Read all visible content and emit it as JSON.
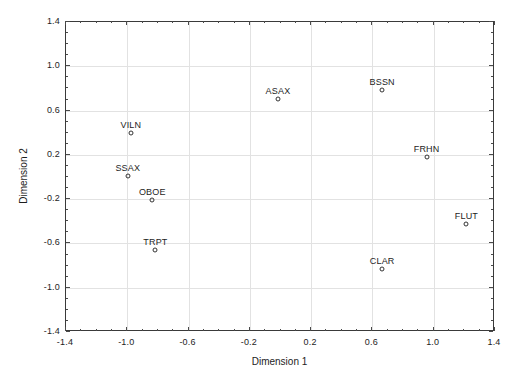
{
  "chart_data": {
    "type": "scatter",
    "title": "",
    "xlabel": "Dimension 1",
    "ylabel": "Dimension 2",
    "xlim": [
      -1.4,
      1.4
    ],
    "ylim": [
      -1.4,
      1.4
    ],
    "xticks": [
      -1.4,
      -1.0,
      -0.6,
      -0.2,
      0.2,
      0.6,
      1.0,
      1.4
    ],
    "yticks": [
      -1.4,
      -1.0,
      -0.6,
      -0.2,
      0.2,
      0.6,
      1.0,
      1.4
    ],
    "xticklabels": [
      "-1.4",
      "-1.0",
      "-0.6",
      "-0.2",
      "0.2",
      "0.6",
      "1.0",
      "1.4"
    ],
    "yticklabels": [
      "-1.4",
      "-1.0",
      "-0.6",
      "-0.2",
      "0.2",
      "0.6",
      "1.0",
      "1.4"
    ],
    "minor_ticks": true,
    "grid": true,
    "grid_color": "#e2e2e2",
    "legend": "none",
    "marker": "open-circle",
    "marker_color": "#333333",
    "points": [
      {
        "label": "VILN",
        "x": -0.97,
        "y": 0.39
      },
      {
        "label": "SSAX",
        "x": -0.99,
        "y": 0.0
      },
      {
        "label": "OBOE",
        "x": -0.83,
        "y": -0.22
      },
      {
        "label": "TRPT",
        "x": -0.81,
        "y": -0.67
      },
      {
        "label": "ASAX",
        "x": -0.01,
        "y": 0.7
      },
      {
        "label": "BSSN",
        "x": 0.67,
        "y": 0.78
      },
      {
        "label": "FRHN",
        "x": 0.96,
        "y": 0.17
      },
      {
        "label": "FLUT",
        "x": 1.22,
        "y": -0.43
      },
      {
        "label": "CLAR",
        "x": 0.67,
        "y": -0.84
      }
    ]
  }
}
